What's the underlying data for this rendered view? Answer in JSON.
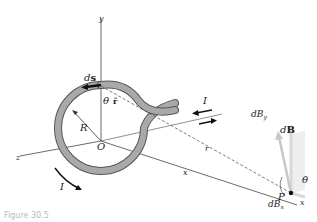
{
  "diagram": {
    "axes": {
      "x": "x",
      "y": "y",
      "z": "z"
    },
    "labels": {
      "ds": "d",
      "ds_bold": "s",
      "theta_top": "θ",
      "rhat": "r̂",
      "current_top": "I",
      "current_bottom": "I",
      "radius": "R",
      "origin": "O",
      "r_distance": "r",
      "x_distance": "x",
      "point": "P",
      "theta_point": "θ",
      "dB": "d",
      "dB_bold": "B",
      "dBy": "dB",
      "dBy_sub": "y",
      "dBx": "dB",
      "dBx_sub": "x"
    },
    "colors": {
      "wire": "#a9a9a9",
      "wire_edge": "#555555",
      "vector_fill": "#e6e6e6",
      "lines": "#333333"
    }
  },
  "caption": {
    "text": "Figure 30.5"
  }
}
